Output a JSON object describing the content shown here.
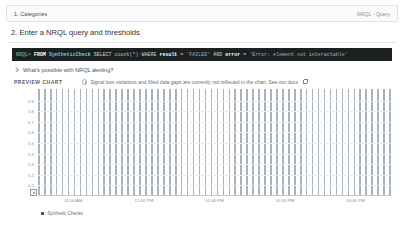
{
  "sections": {
    "collapsed": {
      "title": "1. Categories",
      "meta": "NRQL - Query"
    },
    "open": {
      "title": "2. Enter a NRQL query and thresholds"
    }
  },
  "query": {
    "prompt": "NRQL>",
    "from_keyword": "FROM",
    "table": "SyntheticCheck",
    "select_keyword": "SELECT",
    "aggregate": "count(*)",
    "where_keyword": "WHERE",
    "condition_field": "result",
    "equals": "=",
    "condition_value": "'FAILED'",
    "and_keyword": "AND",
    "second_field": "error",
    "second_equals": "=",
    "second_value": "'Error: element not interactable'"
  },
  "disclosure": {
    "label": "What's possible with NRQL alerting?",
    "icon": "chevron-right-icon",
    "expanded": false
  },
  "preview": {
    "label": "PREVIEW CHART",
    "info_icon": "info-circle-icon",
    "notice": "Signal loss violations and filled data gaps are currently not reflected in the chart. See our docs",
    "link_icon": "external-link-icon"
  },
  "colors": {
    "bar": "#a9b3bb",
    "legend_swatch": "#54585b",
    "query_background": "#1d2021",
    "query_prompt": "#6ec8c8",
    "query_table": "#64d8c6",
    "grid": "#ededee"
  },
  "chart_data": {
    "type": "bar",
    "title": "PREVIEW CHART",
    "xlabel": "",
    "ylabel": "",
    "ylim": [
      0,
      1.0
    ],
    "grid": true,
    "legend_position": "bottom-left",
    "y_ticks": [
      "0.9",
      "0.8",
      "0.7",
      "0.6",
      "0.5",
      "0.4",
      "0.3",
      "0.2",
      "0.1"
    ],
    "y_tick_values": [
      0.9,
      0.8,
      0.7,
      0.6,
      0.5,
      0.4,
      0.3,
      0.2,
      0.1
    ],
    "x_tick_labels": [
      "11:00 AM",
      "12:00 PM",
      "01:00 PM",
      "02:00 PM",
      "03:00 PM"
    ],
    "x_tick_positions_pct": [
      10,
      30,
      50,
      70,
      90
    ],
    "series": [
      {
        "name": "Synthetic Checks",
        "color": "#a9b3bb",
        "values": [
          1,
          1,
          1,
          1,
          1,
          1,
          1,
          1,
          1,
          1,
          1,
          1,
          1,
          1,
          1,
          1,
          1,
          1,
          1,
          1,
          1,
          1,
          1,
          1,
          1,
          1,
          1,
          1,
          1,
          1,
          1,
          1,
          1,
          1,
          1,
          1,
          1,
          1,
          1,
          1,
          1,
          1,
          1,
          1,
          1,
          1,
          1,
          1,
          1,
          1,
          1,
          1,
          1,
          1,
          1,
          1,
          1,
          1,
          1,
          1
        ]
      }
    ],
    "legend": [
      "Synthetic Checks"
    ]
  }
}
